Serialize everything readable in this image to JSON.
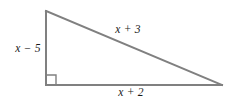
{
  "figure": {
    "type": "right-triangle-diagram",
    "background_color": "#ffffff",
    "stroke_color": "#808080",
    "stroke_width": 2,
    "label_color": "#1a1a1a",
    "vertices": {
      "top": {
        "x": 46,
        "y": 11
      },
      "bottom_left": {
        "x": 46,
        "y": 85
      },
      "bottom_right": {
        "x": 222,
        "y": 85
      }
    },
    "right_angle_marker": {
      "at_vertex": "bottom_left",
      "size": 10,
      "stroke_color": "#808080"
    },
    "labels": {
      "vertical_leg": "x − 5",
      "hypotenuse": "x + 3",
      "horizontal_leg": "x + 2"
    }
  }
}
